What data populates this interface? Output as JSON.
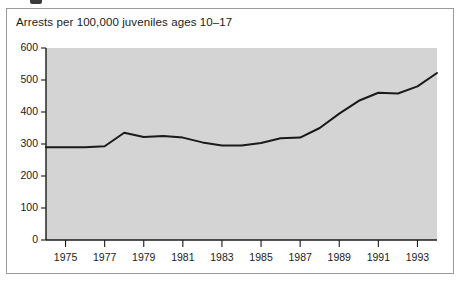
{
  "figure": {
    "marker_present": true,
    "panel_border_color": "#9a9a9a",
    "plot_background_color": "#d4d4d4",
    "line_color": "#1a1a1a"
  },
  "chart_data": {
    "type": "line",
    "title": "Arrests per 100,000 juveniles ages 10–17",
    "xlabel": "",
    "ylabel": "",
    "grid": false,
    "legend": null,
    "xlim": [
      1974,
      1994
    ],
    "ylim": [
      0,
      600
    ],
    "ytick_labels": [
      "600",
      "500",
      "400",
      "300",
      "200",
      "100",
      "0"
    ],
    "ytick_values": [
      600,
      500,
      400,
      300,
      200,
      100,
      0
    ],
    "xtick_labels": [
      "1975",
      "1977",
      "1979",
      "1981",
      "1983",
      "1985",
      "1987",
      "1989",
      "1991",
      "1993"
    ],
    "xtick_values": [
      1975,
      1977,
      1979,
      1981,
      1983,
      1985,
      1987,
      1989,
      1991,
      1993
    ],
    "x": [
      1974,
      1975,
      1976,
      1977,
      1978,
      1979,
      1980,
      1981,
      1982,
      1983,
      1984,
      1985,
      1986,
      1987,
      1988,
      1989,
      1990,
      1991,
      1992,
      1993,
      1994
    ],
    "values": [
      290,
      290,
      290,
      293,
      335,
      322,
      325,
      320,
      305,
      295,
      295,
      303,
      318,
      320,
      350,
      395,
      435,
      460,
      458,
      480,
      522
    ],
    "series": [
      {
        "name": "Arrests per 100,000 juveniles ages 10-17",
        "values": [
          290,
          290,
          290,
          293,
          335,
          322,
          325,
          320,
          305,
          295,
          295,
          303,
          318,
          320,
          350,
          395,
          435,
          460,
          458,
          480,
          522
        ]
      }
    ]
  }
}
